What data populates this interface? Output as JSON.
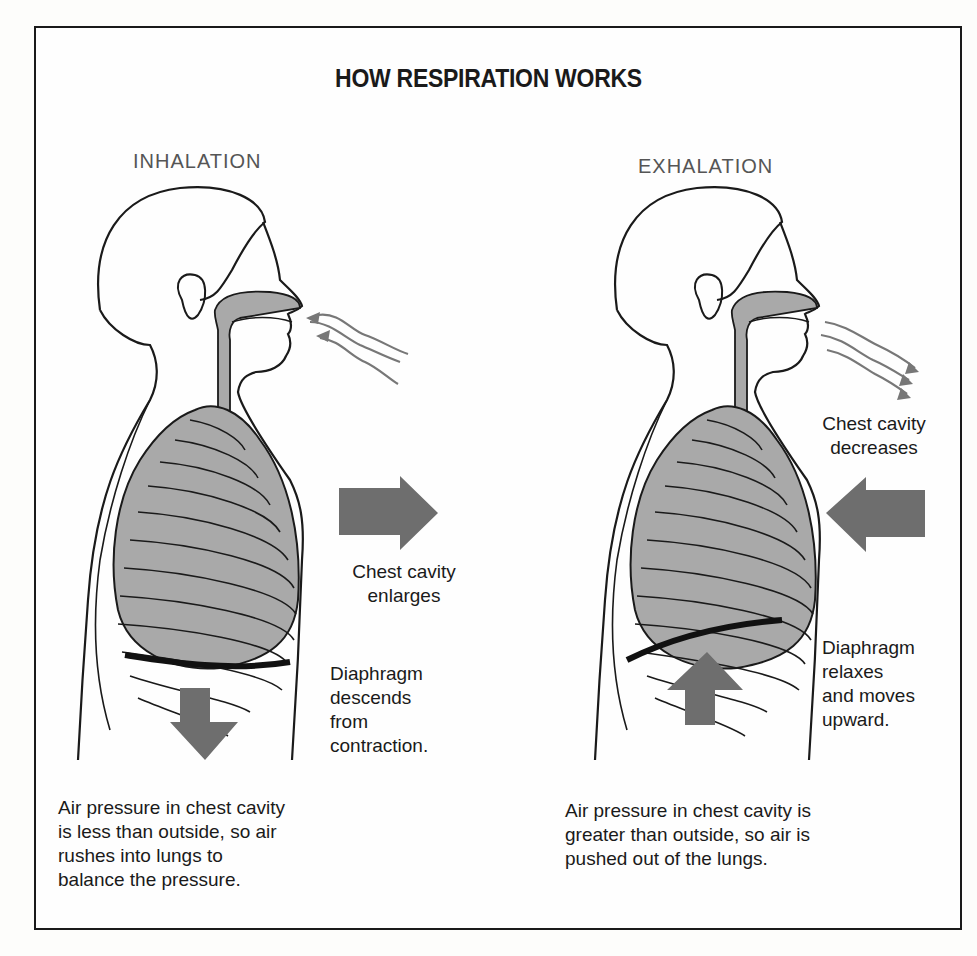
{
  "title": "HOW RESPIRATION WORKS",
  "panels": {
    "inhalation": {
      "heading": "INHALATION",
      "arrow_direction": "right",
      "chest_label": [
        "Chest cavity",
        "enlarges"
      ],
      "diaphragm_label": [
        "Diaphragm",
        "descends",
        "from",
        "contraction."
      ],
      "diaphragm_arrow": "down",
      "air_flow": "into nose",
      "caption": [
        "Air pressure in chest cavity",
        "is less than outside, so air",
        "rushes into lungs to",
        "balance the pressure."
      ]
    },
    "exhalation": {
      "heading": "EXHALATION",
      "arrow_direction": "left",
      "chest_label": [
        "Chest cavity",
        "decreases"
      ],
      "diaphragm_label": [
        "Diaphragm",
        "relaxes",
        "and moves",
        "upward."
      ],
      "diaphragm_arrow": "up",
      "air_flow": "out of nose",
      "caption": [
        "Air pressure in chest cavity is",
        "greater than outside, so air is",
        "pushed out of the lungs."
      ]
    }
  },
  "colors": {
    "line": "#1a1a1a",
    "organ_fill": "#a9a9a9",
    "arrow_fill": "#6e6e6e",
    "airflow": "#777777"
  }
}
